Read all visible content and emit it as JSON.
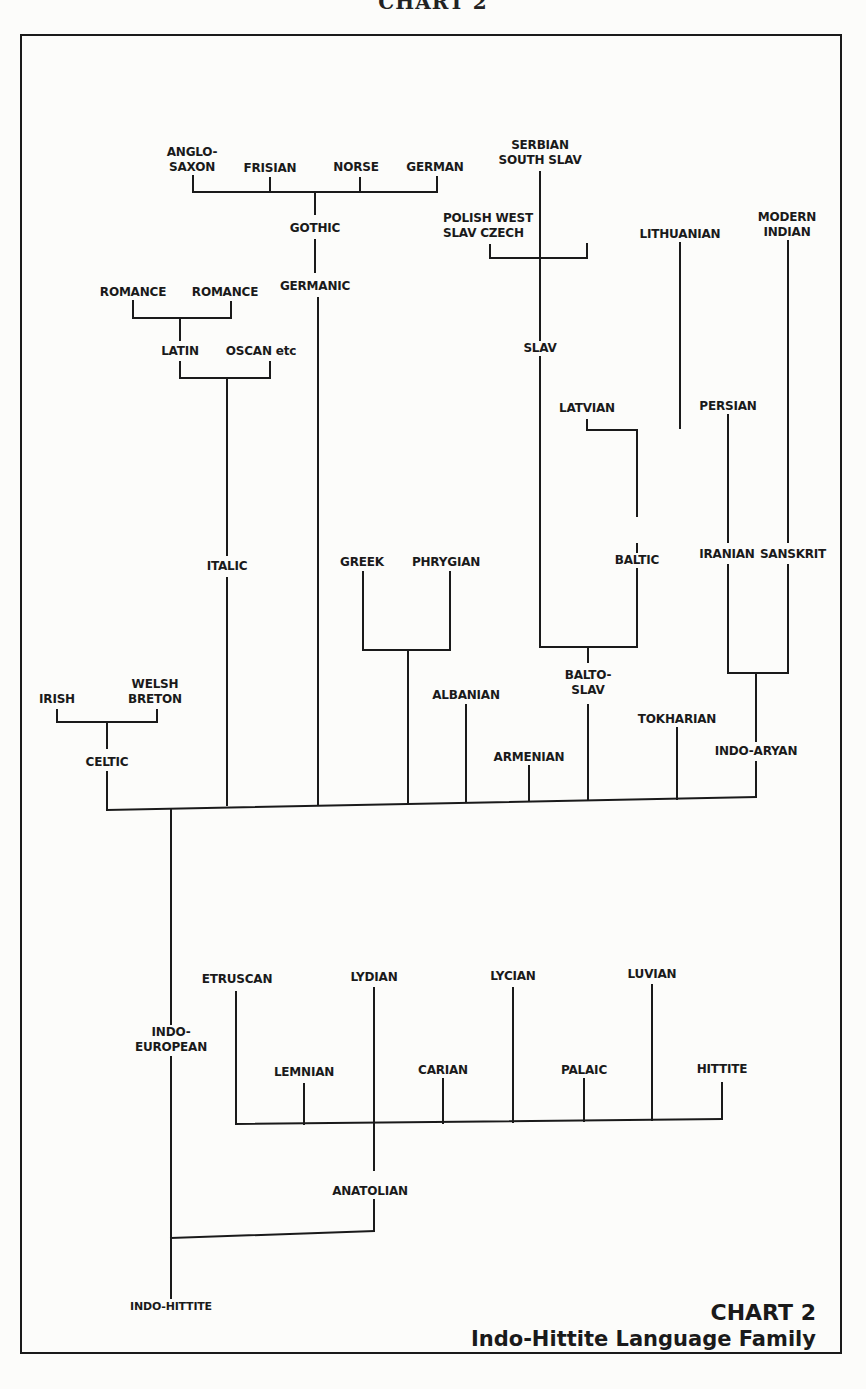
{
  "header": {
    "partial_title": "CHART 2"
  },
  "caption": {
    "chart_label": "CHART 2",
    "title": "Indo-Hittite Language Family"
  },
  "nodes": {
    "anglo_saxon": "ANGLO-\nSAXON",
    "frisian": "FRISIAN",
    "norse": "NORSE",
    "german": "GERMAN",
    "gothic": "GOTHIC",
    "germanic": "GERMANIC",
    "romance_1": "ROMANCE",
    "romance_2": "ROMANCE",
    "latin": "LATIN",
    "oscan": "OSCAN etc",
    "italic": "ITALIC",
    "serbian_south_slav": "SERBIAN\nSOUTH SLAV",
    "polish_west_slav_czech": "POLISH WEST\nSLAV CZECH",
    "slav": "SLAV",
    "lithuanian": "LITHUANIAN",
    "latvian": "LATVIAN",
    "baltic": "BALTIC",
    "balto_slav": "BALTO-\nSLAV",
    "modern_indian": "MODERN\nINDIAN",
    "persian": "PERSIAN",
    "iranian": "IRANIAN",
    "sanskrit": "SANSKRIT",
    "indo_aryan": "INDO-ARYAN",
    "greek": "GREEK",
    "phrygian": "PHRYGIAN",
    "albanian": "ALBANIAN",
    "armenian": "ARMENIAN",
    "tokharian": "TOKHARIAN",
    "irish": "IRISH",
    "welsh_breton": "WELSH\nBRETON",
    "celtic": "CELTIC",
    "indo_european": "INDO-\nEUROPEAN",
    "etruscan": "ETRUSCAN",
    "lydian": "LYDIAN",
    "lycian": "LYCIAN",
    "luvian": "LUVIAN",
    "lemnian": "LEMNIAN",
    "carian": "CARIAN",
    "palaic": "PALAIC",
    "hittite": "HITTITE",
    "anatolian": "ANATOLIAN",
    "indo_hittite": "INDO-HITTITE"
  },
  "tree": {
    "root": "INDO-HITTITE",
    "children": [
      {
        "name": "INDO-EUROPEAN",
        "children": [
          {
            "name": "CELTIC",
            "children": [
              "IRISH",
              "WELSH BRETON"
            ]
          },
          {
            "name": "ITALIC",
            "children": [
              {
                "name": "LATIN",
                "children": [
                  "ROMANCE",
                  "ROMANCE"
                ]
              },
              "OSCAN etc"
            ]
          },
          {
            "name": "GERMANIC",
            "children": [
              {
                "name": "GOTHIC",
                "children": [
                  "ANGLO-SAXON",
                  "FRISIAN",
                  "NORSE",
                  "GERMAN"
                ]
              }
            ]
          },
          {
            "name": "GREEK / PHRYGIAN",
            "children": [
              "GREEK",
              "PHRYGIAN"
            ]
          },
          "ALBANIAN",
          "ARMENIAN",
          {
            "name": "BALTO-SLAV",
            "children": [
              {
                "name": "SLAV",
                "children": [
                  "SERBIAN SOUTH SLAV",
                  "POLISH WEST SLAV CZECH"
                ]
              },
              {
                "name": "BALTIC",
                "children": [
                  "LATVIAN",
                  "LITHUANIAN"
                ]
              }
            ]
          },
          "TOKHARIAN",
          {
            "name": "INDO-ARYAN",
            "children": [
              {
                "name": "IRANIAN",
                "children": [
                  "PERSIAN"
                ]
              },
              {
                "name": "SANSKRIT",
                "children": [
                  "MODERN INDIAN"
                ]
              }
            ]
          }
        ]
      },
      {
        "name": "ANATOLIAN",
        "children": [
          "ETRUSCAN",
          "LEMNIAN",
          "LYDIAN",
          "CARIAN",
          "LYCIAN",
          "PALAIC",
          "LUVIAN",
          "HITTITE"
        ]
      }
    ]
  }
}
